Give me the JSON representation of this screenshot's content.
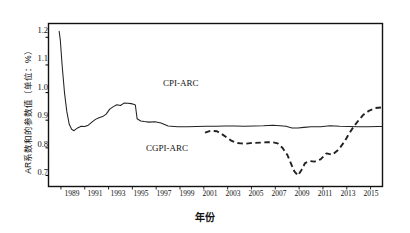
{
  "chart_data": {
    "type": "line",
    "title": "",
    "xlabel": "年份",
    "ylabel": "AR系数和的参数值（单位：%）",
    "xlim": [
      1988,
      2016
    ],
    "ylim": [
      0.66,
      1.25
    ],
    "yticks": [
      0.7,
      0.8,
      0.9,
      1.0,
      1.1,
      1.2
    ],
    "ytick_labels": [
      "0.7",
      "0.8",
      "0.9",
      "1.0",
      "1.1",
      "1.2"
    ],
    "xticks": [
      1989,
      1991,
      1993,
      1995,
      1997,
      1999,
      2001,
      2003,
      2005,
      2007,
      2009,
      2011,
      2013,
      2015
    ],
    "xtick_labels": [
      "1989",
      "1991",
      "1993",
      "1995",
      "1997",
      "1999",
      "2001",
      "2003",
      "2005",
      "2007",
      "2009",
      "2011",
      "2013",
      "2015"
    ],
    "grid": false,
    "legend_position": "inline-annotations",
    "series": [
      {
        "name": "CPI-ARC",
        "style": "solid",
        "color": "#222222",
        "x": [
          1988.85,
          1988.95,
          1989.1,
          1989.3,
          1989.5,
          1989.7,
          1989.9,
          1990.1,
          1990.4,
          1990.7,
          1991.0,
          1991.3,
          1991.6,
          1991.9,
          1992.2,
          1992.5,
          1992.8,
          1993.1,
          1993.4,
          1993.7,
          1994.0,
          1994.3,
          1994.6,
          1994.9,
          1995.1,
          1995.25,
          1995.4,
          1995.7,
          1996.0,
          1996.4,
          1996.9,
          1997.4,
          1998.0,
          1998.8,
          1999.6,
          2000.4,
          2001.2,
          2002.0,
          2002.8,
          2003.6,
          2004.4,
          2005.2,
          2006.0,
          2006.8,
          2007.4,
          2007.9,
          2008.4,
          2008.9,
          2009.4,
          2010.0,
          2010.8,
          2011.6,
          2012.4,
          2013.2,
          2014.0,
          2014.8,
          2015.6,
          2016.0
        ],
        "y": [
          1.222,
          1.19,
          1.1,
          1.0,
          0.93,
          0.885,
          0.867,
          0.862,
          0.872,
          0.878,
          0.877,
          0.882,
          0.893,
          0.903,
          0.909,
          0.913,
          0.922,
          0.94,
          0.949,
          0.956,
          0.953,
          0.962,
          0.961,
          0.96,
          0.958,
          0.955,
          0.905,
          0.897,
          0.895,
          0.893,
          0.894,
          0.89,
          0.879,
          0.876,
          0.876,
          0.877,
          0.878,
          0.878,
          0.879,
          0.879,
          0.878,
          0.879,
          0.88,
          0.882,
          0.88,
          0.878,
          0.872,
          0.872,
          0.874,
          0.876,
          0.876,
          0.88,
          0.878,
          0.877,
          0.876,
          0.876,
          0.877,
          0.877
        ]
      },
      {
        "name": "CGPI-ARC",
        "style": "dashed",
        "color": "#222222",
        "x": [
          2001.1,
          2001.6,
          2002.1,
          2002.5,
          2002.9,
          2003.3,
          2003.7,
          2004.1,
          2004.5,
          2004.9,
          2005.3,
          2005.8,
          2006.3,
          2006.8,
          2007.2,
          2007.6,
          2008.0,
          2008.3,
          2008.6,
          2008.9,
          2009.2,
          2009.5,
          2009.9,
          2010.3,
          2010.8,
          2011.3,
          2011.8,
          2012.3,
          2012.8,
          2013.2,
          2013.6,
          2014.0,
          2014.4,
          2014.9,
          2015.4,
          2015.9,
          2016.0
        ],
        "y": [
          0.855,
          0.862,
          0.86,
          0.85,
          0.838,
          0.826,
          0.818,
          0.816,
          0.815,
          0.817,
          0.818,
          0.819,
          0.82,
          0.82,
          0.816,
          0.8,
          0.775,
          0.745,
          0.715,
          0.7,
          0.72,
          0.745,
          0.752,
          0.75,
          0.758,
          0.78,
          0.775,
          0.793,
          0.822,
          0.852,
          0.878,
          0.9,
          0.92,
          0.935,
          0.944,
          0.946,
          0.946
        ]
      }
    ],
    "annotations": [
      {
        "text": "CPI-ARC",
        "series": "CPI-ARC"
      },
      {
        "text": "CGPI-ARC",
        "series": "CGPI-ARC"
      }
    ]
  },
  "axis": {
    "y_label": "AR系数和的参数值（单位：%）",
    "x_label": "年份"
  },
  "labels": {
    "cpi": "CPI-ARC",
    "cgpi": "CGPI-ARC"
  },
  "yticks": {
    "t0": "0.7",
    "t1": "0.8",
    "t2": "0.9",
    "t3": "1.0",
    "t4": "1.1",
    "t5": "1.2"
  },
  "xticks": {
    "t0": "1989",
    "t1": "1991",
    "t2": "1993",
    "t3": "1995",
    "t4": "1997",
    "t5": "1999",
    "t6": "2001",
    "t7": "2003",
    "t8": "2005",
    "t9": "2007",
    "t10": "2009",
    "t11": "2011",
    "t12": "2013",
    "t13": "2015"
  }
}
